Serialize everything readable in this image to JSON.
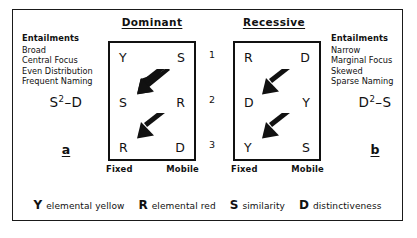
{
  "figure": {
    "panels": [
      {
        "id": "dominant",
        "title": "Dominant",
        "letter": "a",
        "formula_base": "S",
        "formula_exponent": "2",
        "formula_tail": "–D",
        "entailments": {
          "heading": "Entailments",
          "items": [
            "Broad",
            "Central Focus",
            "Even Distribution",
            "Frequent Naming"
          ]
        },
        "axis": {
          "left": "Fixed",
          "right": "Mobile"
        },
        "matrix": [
          {
            "fixed": "Y",
            "mobile": "S"
          },
          {
            "fixed": "S",
            "mobile": "R"
          },
          {
            "fixed": "R",
            "mobile": "D"
          }
        ],
        "arrows": [
          "down-left-arrow",
          "down-left-arrow"
        ]
      },
      {
        "id": "recessive",
        "title": "Recessive",
        "letter": "b",
        "formula_base": "D",
        "formula_exponent": "2",
        "formula_tail": "–S",
        "entailments": {
          "heading": "Entailments",
          "items": [
            "Narrow",
            "Marginal Focus",
            "Skewed",
            "Sparse Naming"
          ]
        },
        "axis": {
          "left": "Fixed",
          "right": "Mobile"
        },
        "matrix": [
          {
            "fixed": "R",
            "mobile": "D"
          },
          {
            "fixed": "D",
            "mobile": "Y"
          },
          {
            "fixed": "Y",
            "mobile": "S"
          }
        ],
        "arrows": [
          "down-left-arrow",
          "down-left-arrow"
        ]
      }
    ],
    "row_numbers": [
      "1",
      "2",
      "3"
    ],
    "legend": [
      {
        "symbol": "Y",
        "text": "elemental yellow"
      },
      {
        "symbol": "R",
        "text": "elemental red"
      },
      {
        "symbol": "S",
        "text": "similarity"
      },
      {
        "symbol": "D",
        "text": "distinctiveness"
      }
    ],
    "colors": {
      "ink": "#111111",
      "background": "#ffffff"
    }
  }
}
